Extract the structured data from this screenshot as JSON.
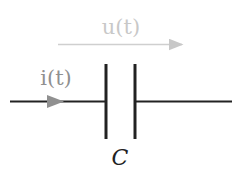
{
  "diagram": {
    "voltage_label": "u(t)",
    "current_label": "i(t)",
    "component_label": "C",
    "colors": {
      "wire": "#222222",
      "voltage": "#c8c8c8",
      "current": "#909090",
      "component_label": "#222222"
    }
  }
}
